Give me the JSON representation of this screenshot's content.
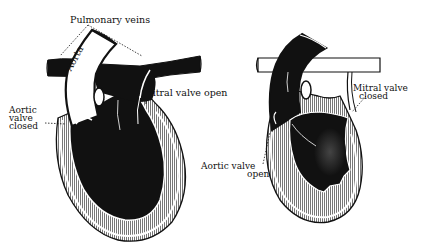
{
  "diagram": {
    "left_heart": {
      "labels": {
        "pulmonary_veins": "Pulmonary veins",
        "aorta": "Aorta",
        "mitral_valve": "Mitral valve open",
        "aortic_valve_line1": "Aortic",
        "aortic_valve_line2": "valve",
        "aortic_valve_line3": "closed"
      }
    },
    "right_heart": {
      "labels": {
        "mitral_valve_line1": "Mitral valve",
        "mitral_valve_line2": "closed",
        "aortic_valve_line1": "Aortic valve",
        "aortic_valve_line2": "open"
      }
    },
    "colors": {
      "ink": "#111111",
      "background": "#ffffff",
      "muscle_hatch": "#8a8a8a",
      "contracted_blood": "#3a3a3a"
    }
  }
}
